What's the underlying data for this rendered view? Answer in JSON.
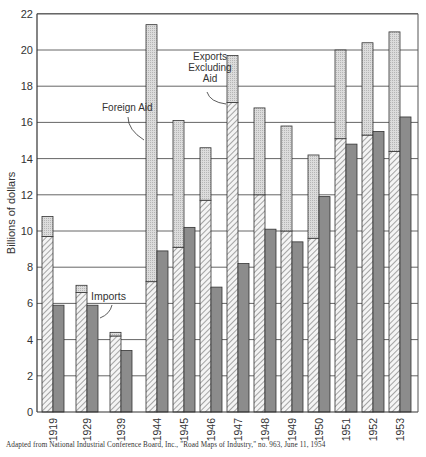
{
  "chart_data": {
    "type": "bar",
    "title": "",
    "xlabel": "",
    "ylabel": "Billions of dollars",
    "ylim": [
      0,
      22
    ],
    "yticks": [
      0,
      2,
      4,
      6,
      8,
      10,
      12,
      14,
      16,
      18,
      20,
      22
    ],
    "grid": true,
    "categories": [
      "1919",
      "1929",
      "1939",
      "1944",
      "1945",
      "1946",
      "1947",
      "1948",
      "1949",
      "1950",
      "1951",
      "1952",
      "1953"
    ],
    "series": [
      {
        "name": "Exports Excluding Aid",
        "pattern": "hatched",
        "stack": "exports",
        "values": [
          9.7,
          6.6,
          4.2,
          7.2,
          9.1,
          11.7,
          17.1,
          12.0,
          10.0,
          9.6,
          15.1,
          15.3,
          14.4
        ]
      },
      {
        "name": "Foreign Aid",
        "pattern": "stippled",
        "stack": "exports",
        "values": [
          1.1,
          0.4,
          0.2,
          14.2,
          7.0,
          2.9,
          2.6,
          4.8,
          5.8,
          4.6,
          4.9,
          5.1,
          6.6
        ]
      },
      {
        "name": "Imports",
        "pattern": "dark",
        "stack": "imports",
        "values": [
          5.9,
          5.9,
          3.4,
          8.9,
          10.2,
          6.9,
          8.2,
          10.1,
          9.4,
          11.9,
          14.8,
          15.5,
          16.3
        ]
      }
    ],
    "annotations": [
      {
        "text": "Foreign Aid",
        "lines": [
          "Foreign Aid"
        ]
      },
      {
        "text": "Exports Excluding Aid",
        "lines": [
          "Exports",
          "Excluding",
          "Aid"
        ]
      },
      {
        "text": "Imports",
        "lines": [
          "Imports"
        ]
      }
    ],
    "source": "Adapted from National Industrial Conference Board, Inc., \"Road Maps of Industry,\" no. 963, June 11, 1954"
  },
  "colors": {
    "stipple": "#d4d4d4",
    "hatch_bg": "#f2f2f2",
    "hatch_line": "#555555",
    "imports": "#8a8a8a",
    "grid": "#444444"
  }
}
